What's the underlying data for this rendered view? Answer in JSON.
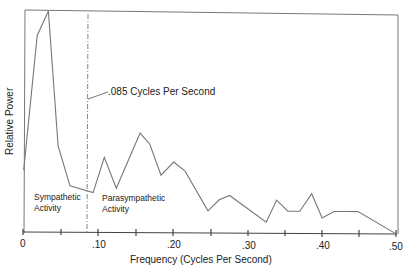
{
  "chart_data": {
    "type": "line",
    "title": "",
    "xlabel": "Frequency (Cycles Per Second)",
    "ylabel": "Relative Power",
    "xlim": [
      0,
      0.5
    ],
    "ylim": [
      0,
      1.0
    ],
    "x_tick_labels": [
      "0",
      ".10",
      ".20",
      ".30",
      ".40",
      ".50"
    ],
    "x_ticks": [
      0,
      0.05,
      0.1,
      0.15,
      0.2,
      0.25,
      0.3,
      0.35,
      0.4,
      0.45,
      0.5
    ],
    "grid": false,
    "legend": null,
    "series": [
      {
        "name": "Power Spectrum",
        "x": [
          0.001,
          0.019,
          0.034,
          0.047,
          0.063,
          0.094,
          0.109,
          0.125,
          0.157,
          0.17,
          0.185,
          0.202,
          0.217,
          0.248,
          0.263,
          0.277,
          0.326,
          0.34,
          0.355,
          0.371,
          0.387,
          0.401,
          0.417,
          0.434,
          0.449,
          0.5
        ],
        "values": [
          0.28,
          0.89,
          1.0,
          0.39,
          0.21,
          0.18,
          0.34,
          0.2,
          0.45,
          0.4,
          0.26,
          0.32,
          0.28,
          0.1,
          0.15,
          0.17,
          0.05,
          0.15,
          0.1,
          0.1,
          0.18,
          0.07,
          0.1,
          0.1,
          0.1,
          0.0
        ]
      }
    ],
    "annotations": [
      {
        "type": "vline",
        "x": 0.085,
        "style": "dash-dot",
        "label": ".085 Cycles Per Second"
      },
      {
        "type": "text",
        "text": "Sympathetic Activity",
        "region": "left of .085"
      },
      {
        "type": "text",
        "text": "Parasympathetic Activity",
        "region": "right of .085"
      }
    ]
  },
  "labels": {
    "ylabel": "Relative Power",
    "xlabel": "Frequency (Cycles Per Second)",
    "divider": ".085 Cycles Per Second",
    "sympathetic_1": "Sympathetic",
    "sympathetic_2": "Activity",
    "parasympathetic_1": "Parasympathetic",
    "parasympathetic_2": "Activity",
    "ticks": [
      "0",
      ".10",
      ".20",
      ".30",
      ".40",
      ".50"
    ]
  }
}
